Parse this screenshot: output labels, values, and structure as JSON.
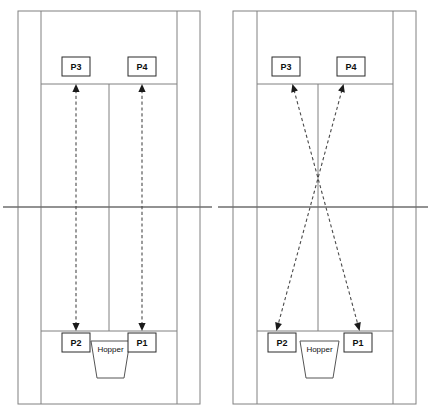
{
  "diagram": {
    "colors": {
      "court_line": "#808080",
      "net_line": "#6e6e6e",
      "arrow": "#4a4a4a",
      "box_border": "#2b2b2b",
      "text": "#101010",
      "background": "#ffffff"
    }
  },
  "courts": [
    {
      "id": "left-court",
      "name": "parallel-drill-court",
      "pattern": "straight",
      "players": [
        {
          "id": "p3",
          "label": "P3",
          "position": "top-left"
        },
        {
          "id": "p4",
          "label": "P4",
          "position": "top-right"
        },
        {
          "id": "p2",
          "label": "P2",
          "position": "bottom-left"
        },
        {
          "id": "p1",
          "label": "P1",
          "position": "bottom-right"
        }
      ],
      "hopper": {
        "label": "Hopper"
      },
      "arrows": [
        {
          "id": "arrow-p3-p2",
          "from": "P2",
          "to": "P3",
          "style": "double-headed-dashed",
          "direction": "vertical"
        },
        {
          "id": "arrow-p4-p1",
          "from": "P1",
          "to": "P4",
          "style": "double-headed-dashed",
          "direction": "vertical"
        }
      ]
    },
    {
      "id": "right-court",
      "name": "crosscourt-drill-court",
      "pattern": "crossing",
      "players": [
        {
          "id": "p3",
          "label": "P3",
          "position": "top-left"
        },
        {
          "id": "p4",
          "label": "P4",
          "position": "top-right"
        },
        {
          "id": "p2",
          "label": "P2",
          "position": "bottom-left"
        },
        {
          "id": "p1",
          "label": "P1",
          "position": "bottom-right"
        }
      ],
      "hopper": {
        "label": "Hopper"
      },
      "arrows": [
        {
          "id": "arrow-p3-p1",
          "from": "P1",
          "to": "P3",
          "style": "double-headed-dashed",
          "direction": "diagonal"
        },
        {
          "id": "arrow-p4-p2",
          "from": "P2",
          "to": "P4",
          "style": "double-headed-dashed",
          "direction": "diagonal"
        }
      ]
    }
  ],
  "geometry": {
    "canvas": {
      "width": 430,
      "height": 415
    },
    "left": {
      "outer_left": 18,
      "inner_left": 41,
      "center": 109,
      "inner_right": 177,
      "outer_right": 200,
      "net_x1": 3,
      "net_x2": 212,
      "cross_x": 109
    },
    "right": {
      "outer_left": 233,
      "inner_left": 257,
      "center": 318,
      "inner_right": 393,
      "outer_right": 416,
      "net_x1": 218,
      "net_x2": 428,
      "cross_x": 318
    },
    "baseline_top": 11,
    "baseline_bottom": 404,
    "service_top": 84,
    "service_bottom": 331,
    "net_y": 207,
    "box": {
      "w": 28,
      "h": 19
    },
    "box_top_y": 57,
    "box_bottom_y": 331,
    "hopper_y": 345
  }
}
